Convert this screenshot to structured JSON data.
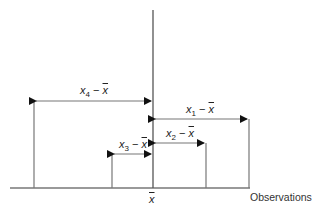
{
  "diagram": {
    "type": "deviations-from-mean",
    "axis_label": "Observations",
    "mean_label": "x",
    "deviations": [
      {
        "id": "x4",
        "var": "x",
        "sub": "4",
        "mean": "x",
        "label": "x4 − x̄",
        "direction": "left"
      },
      {
        "id": "x1",
        "var": "x",
        "sub": "1",
        "mean": "x",
        "label": "x1 − x̄",
        "direction": "right"
      },
      {
        "id": "x2",
        "var": "x",
        "sub": "2",
        "mean": "x",
        "label": "x2 − x̄",
        "direction": "right"
      },
      {
        "id": "x3",
        "var": "x",
        "sub": "3",
        "mean": "x",
        "label": "x3 − x̄",
        "direction": "left"
      }
    ],
    "minus": "−",
    "colors": {
      "line": "#555555",
      "text": "#222222"
    }
  }
}
